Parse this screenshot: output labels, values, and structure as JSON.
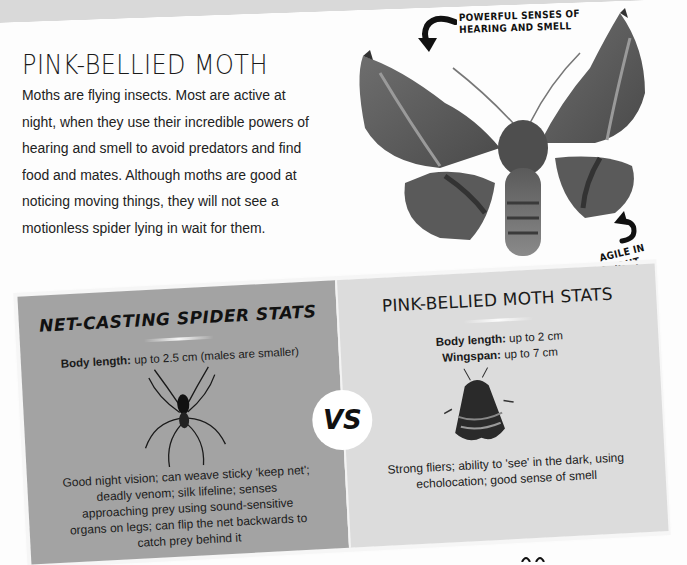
{
  "header": {
    "title": "PINK-BELLIED MOTH",
    "intro": "Moths are flying insects. Most are active at night, when they use their incredible powers of hearing and smell to avoid predators and find food and mates. Although moths are good at noticing moving things, they will not see a motionless spider lying in wait for them."
  },
  "photo": {
    "subject": "pink-bellied moth",
    "callouts": {
      "top": "POWERFUL SENSES OF HEARING AND SMELL",
      "top_line1": "POWERFUL SENSES OF",
      "top_line2": "HEARING AND SMELL",
      "bottom": "AGILE IN FLIGHT"
    }
  },
  "comparison": {
    "vs_label": "VS",
    "spider": {
      "title": "NET-CASTING SPIDER STATS",
      "stats": [
        {
          "label": "Body length:",
          "value": "up to 2.5 cm (males are smaller)"
        }
      ],
      "description": "Good night vision; can weave sticky 'keep net'; deadly venom; silk lifeline; senses approaching prey using sound-sensitive organs on legs; can flip the net backwards to catch prey behind it",
      "illustration": "spider-icon"
    },
    "moth": {
      "title": "PINK-BELLIED MOTH STATS",
      "stats": [
        {
          "label": "Body length:",
          "value": "up to 2 cm"
        },
        {
          "label": "Wingspan:",
          "value": "up to 7 cm"
        }
      ],
      "description": "Strong fliers; ability to 'see' in the dark, using echolocation; good sense of smell",
      "illustration": "moth-icon"
    }
  },
  "colors": {
    "spider_panel": "#a3a3a3",
    "moth_panel": "#dcdcdc",
    "text": "#1f1f1f"
  }
}
